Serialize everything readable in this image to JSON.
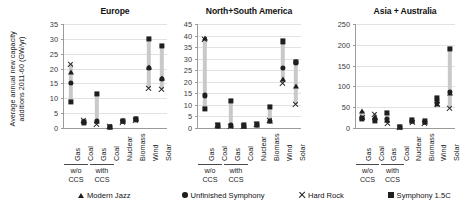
{
  "figure": {
    "ylabel": "Average annual new capacity additions 2011-60 (GW/yr)",
    "ylabel_line1": "Average annual new capacity",
    "ylabel_line2": "additions 2011-60 (GW/yr)"
  },
  "legend": {
    "position": "bottom",
    "items": [
      {
        "label": "Modern Jazz",
        "marker": "triangle",
        "color": "#1f1f1f"
      },
      {
        "label": "Unfinished Symphony",
        "marker": "circle",
        "color": "#1f1f1f"
      },
      {
        "label": "Hard Rock",
        "marker": "x",
        "color": "#1f1f1f"
      },
      {
        "label": "Symphony 1.5C",
        "marker": "square",
        "color": "#1f1f1f"
      }
    ]
  },
  "categories": [
    "Gas",
    "Coal",
    "Gas",
    "Coal",
    "Nuclear",
    "Biomass",
    "Wind",
    "Solar"
  ],
  "groups": [
    {
      "label_line1": "w/o",
      "label_line2": "CCS",
      "span": [
        0,
        1
      ]
    },
    {
      "label_line1": "with",
      "label_line2": "CCS",
      "span": [
        2,
        3
      ]
    }
  ],
  "chart_data": [
    {
      "type": "scatter",
      "title": "Europe",
      "xlabel": "",
      "ylabel": "Average annual new capacity additions 2011-60 (GW/yr)",
      "ylim": [
        0,
        35
      ],
      "yticks": [
        0,
        5,
        10,
        15,
        20,
        25,
        30,
        35
      ],
      "grid": true,
      "categories": [
        "Gas",
        "Coal",
        "Gas",
        "Coal",
        "Nuclear",
        "Biomass",
        "Wind",
        "Solar"
      ],
      "series": [
        {
          "name": "Modern Jazz",
          "marker": "triangle",
          "values": [
            19.0,
            2.3,
            2.5,
            0.5,
            2.2,
            3.0,
            20.6,
            16.8
          ]
        },
        {
          "name": "Unfinished Symphony",
          "marker": "circle",
          "values": [
            15.3,
            2.0,
            2.3,
            0.5,
            2.3,
            2.9,
            20.3,
            16.5
          ]
        },
        {
          "name": "Hard Rock",
          "marker": "x",
          "values": [
            21.5,
            2.6,
            1.2,
            0.4,
            2.0,
            2.6,
            13.4,
            13.0
          ]
        },
        {
          "name": "Symphony 1.5C",
          "marker": "square",
          "values": [
            8.8,
            1.9,
            11.6,
            0.5,
            2.4,
            3.1,
            30.1,
            27.7
          ]
        }
      ]
    },
    {
      "type": "scatter",
      "title": "North+South  America",
      "xlabel": "",
      "ylabel": "",
      "ylim": [
        0,
        45
      ],
      "yticks": [
        0,
        5,
        10,
        15,
        20,
        25,
        30,
        35,
        40,
        45
      ],
      "grid": true,
      "categories": [
        "Gas",
        "Coal",
        "Gas",
        "Coal",
        "Nuclear",
        "Biomass",
        "Wind",
        "Solar"
      ],
      "series": [
        {
          "name": "Modern Jazz",
          "marker": "triangle",
          "values": [
            38.8,
            1.0,
            1.3,
            1.0,
            1.5,
            3.2,
            21.0,
            18.0
          ]
        },
        {
          "name": "Unfinished Symphony",
          "marker": "circle",
          "values": [
            14.1,
            0.9,
            1.1,
            0.9,
            1.4,
            3.0,
            25.9,
            28.4
          ]
        },
        {
          "name": "Hard Rock",
          "marker": "x",
          "values": [
            38.5,
            1.1,
            0.7,
            0.8,
            1.3,
            3.4,
            19.3,
            10.2
          ]
        },
        {
          "name": "Symphony 1.5C",
          "marker": "square",
          "values": [
            8.4,
            1.2,
            11.7,
            1.1,
            1.7,
            9.0,
            37.5,
            28.6
          ]
        }
      ]
    },
    {
      "type": "scatter",
      "title": "Asia + Australia",
      "xlabel": "",
      "ylabel": "",
      "ylim": [
        0,
        250
      ],
      "yticks": [
        0,
        50,
        100,
        150,
        200,
        250
      ],
      "grid": true,
      "categories": [
        "Gas",
        "Coal",
        "Gas",
        "Coal",
        "Nuclear",
        "Biomass",
        "Wind",
        "Solar"
      ],
      "series": [
        {
          "name": "Modern Jazz",
          "marker": "triangle",
          "values": [
            40.0,
            26.0,
            20.0,
            2.0,
            16.0,
            14.0,
            58.0,
            84.0
          ]
        },
        {
          "name": "Unfinished Symphony",
          "marker": "circle",
          "values": [
            25.0,
            22.0,
            22.0,
            2.0,
            17.0,
            15.0,
            60.0,
            86.0
          ]
        },
        {
          "name": "Hard Rock",
          "marker": "x",
          "values": [
            26.0,
            33.0,
            12.0,
            1.0,
            13.0,
            12.0,
            57.0,
            47.0
          ]
        },
        {
          "name": "Symphony 1.5C",
          "marker": "square",
          "values": [
            21.0,
            18.0,
            36.0,
            3.0,
            19.0,
            17.0,
            71.0,
            190.0
          ]
        }
      ]
    }
  ]
}
